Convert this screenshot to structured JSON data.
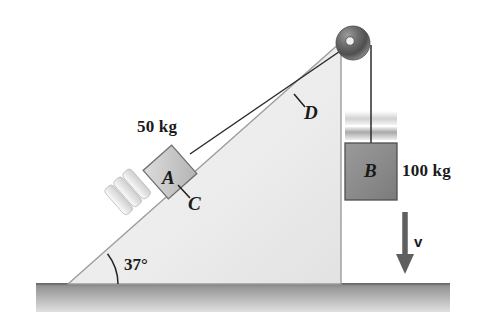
{
  "figure": {
    "type": "physics-free-body-diagram",
    "labels": {
      "mass_a": "50 kg",
      "mass_b": "100 kg",
      "block_a": "A",
      "block_b": "B",
      "point_c": "C",
      "point_d": "D",
      "incline_angle": "37°",
      "velocity": "v"
    },
    "values": {
      "mass_a_kg": 50,
      "mass_b_kg": 100,
      "incline_angle_deg": 37
    },
    "colors": {
      "incline_fill": "#ededed",
      "incline_stroke": "#9a9a9a",
      "ground_top": "#8c8c8c",
      "ground_bottom": "#d8d8d8",
      "block_a_fill": "#c9c9c9",
      "block_a_stroke": "#6e6e6e",
      "block_b_fill": "#8c8c8c",
      "block_b_stroke": "#4a4a4a",
      "pulley_dark": "#4a4a4a",
      "pulley_light": "#b8b8b8",
      "cord": "#2b2b2b",
      "text": "#1a1a1a",
      "pad_fill": "#e3e3e3",
      "band_fill": "#bcbcbc"
    },
    "geometry": {
      "incline_apex": [
        341,
        42
      ],
      "incline_base_left": [
        68,
        284
      ],
      "incline_base_right": [
        341,
        284
      ],
      "pulley_center": [
        353,
        43
      ],
      "pulley_radius": 17,
      "block_b_rect": [
        345,
        143,
        52,
        57
      ],
      "velocity_arrow": [
        405,
        212,
        405,
        272
      ]
    }
  }
}
